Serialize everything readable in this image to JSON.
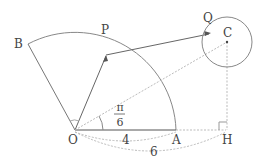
{
  "points": {
    "O": "O",
    "A": "A",
    "B": "B",
    "P": "P",
    "Q": "Q",
    "C": "C",
    "H": "H"
  },
  "angle": {
    "numerator": "π",
    "denominator": "6"
  },
  "lengths": {
    "OA": "4",
    "OH": "6"
  },
  "colors": {
    "line": "#777777",
    "dotted": "#bbbbbb"
  }
}
